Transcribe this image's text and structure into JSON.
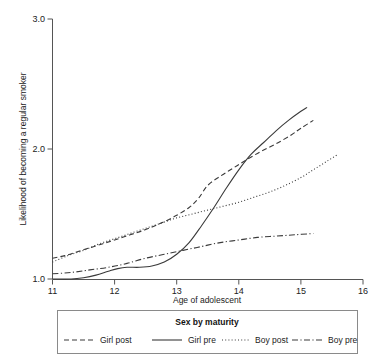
{
  "chart_data": {
    "type": "line",
    "title": "",
    "xlabel": "Age of adolescent",
    "ylabel": "Likelihood of becoming a regular smoker",
    "xlim": [
      11,
      16
    ],
    "ylim": [
      1.0,
      3.0
    ],
    "xticks": [
      "11",
      "12",
      "13",
      "14",
      "15",
      "16"
    ],
    "yticks": [
      "1.0",
      "2.0",
      "3.0"
    ],
    "grid": false,
    "legend_position": "bottom",
    "legend_title": "Sex by maturity",
    "series": [
      {
        "name": "Girl post",
        "style": "dashed",
        "color": "#3a3a3a",
        "points": [
          [
            11.0,
            1.16
          ],
          [
            11.2,
            1.18
          ],
          [
            11.4,
            1.21
          ],
          [
            11.6,
            1.24
          ],
          [
            11.8,
            1.27
          ],
          [
            12.0,
            1.3
          ],
          [
            12.25,
            1.34
          ],
          [
            12.5,
            1.38
          ],
          [
            12.75,
            1.43
          ],
          [
            13.0,
            1.49
          ],
          [
            13.2,
            1.55
          ],
          [
            13.35,
            1.62
          ],
          [
            13.5,
            1.72
          ],
          [
            13.7,
            1.79
          ],
          [
            13.9,
            1.85
          ],
          [
            14.1,
            1.91
          ],
          [
            14.35,
            1.98
          ],
          [
            14.6,
            2.04
          ],
          [
            14.85,
            2.11
          ],
          [
            15.0,
            2.16
          ],
          [
            15.2,
            2.22
          ]
        ]
      },
      {
        "name": "Girl pre",
        "style": "solid",
        "color": "#3a3a3a",
        "points": [
          [
            11.0,
            1.0
          ],
          [
            11.3,
            1.0
          ],
          [
            11.5,
            1.01
          ],
          [
            11.7,
            1.03
          ],
          [
            11.9,
            1.06
          ],
          [
            12.05,
            1.08
          ],
          [
            12.2,
            1.09
          ],
          [
            12.4,
            1.09
          ],
          [
            12.6,
            1.1
          ],
          [
            12.8,
            1.13
          ],
          [
            13.0,
            1.19
          ],
          [
            13.2,
            1.28
          ],
          [
            13.4,
            1.41
          ],
          [
            13.6,
            1.55
          ],
          [
            13.8,
            1.7
          ],
          [
            14.0,
            1.84
          ],
          [
            14.2,
            1.96
          ],
          [
            14.4,
            2.05
          ],
          [
            14.6,
            2.14
          ],
          [
            14.8,
            2.22
          ],
          [
            15.0,
            2.29
          ],
          [
            15.1,
            2.32
          ]
        ]
      },
      {
        "name": "Boy post",
        "style": "dotted",
        "color": "#3a3a3a",
        "points": [
          [
            11.0,
            1.13
          ],
          [
            11.25,
            1.18
          ],
          [
            11.5,
            1.22
          ],
          [
            11.75,
            1.27
          ],
          [
            12.0,
            1.31
          ],
          [
            12.25,
            1.35
          ],
          [
            12.5,
            1.39
          ],
          [
            12.75,
            1.43
          ],
          [
            13.0,
            1.47
          ],
          [
            13.25,
            1.5
          ],
          [
            13.5,
            1.53
          ],
          [
            13.75,
            1.56
          ],
          [
            14.0,
            1.59
          ],
          [
            14.25,
            1.63
          ],
          [
            14.5,
            1.67
          ],
          [
            14.75,
            1.72
          ],
          [
            15.0,
            1.78
          ],
          [
            15.2,
            1.84
          ],
          [
            15.4,
            1.9
          ],
          [
            15.6,
            1.96
          ]
        ]
      },
      {
        "name": "Boy pre",
        "style": "dashdot",
        "color": "#3a3a3a",
        "points": [
          [
            11.0,
            1.04
          ],
          [
            11.3,
            1.05
          ],
          [
            11.6,
            1.07
          ],
          [
            11.9,
            1.09
          ],
          [
            12.2,
            1.12
          ],
          [
            12.5,
            1.16
          ],
          [
            12.8,
            1.19
          ],
          [
            13.1,
            1.22
          ],
          [
            13.4,
            1.25
          ],
          [
            13.7,
            1.28
          ],
          [
            14.0,
            1.3
          ],
          [
            14.3,
            1.32
          ],
          [
            14.6,
            1.33
          ],
          [
            14.9,
            1.34
          ],
          [
            15.2,
            1.35
          ]
        ]
      }
    ]
  },
  "legend": {
    "title": "Sex by maturity",
    "entries": [
      {
        "label": "Girl post",
        "style": "dashed"
      },
      {
        "label": "Girl pre",
        "style": "solid"
      },
      {
        "label": "Boy post",
        "style": "dotted"
      },
      {
        "label": "Boy pre",
        "style": "dashdot"
      }
    ]
  }
}
